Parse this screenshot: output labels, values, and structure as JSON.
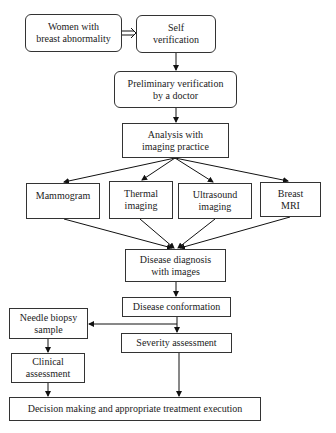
{
  "diagram": {
    "type": "flowchart",
    "nodes": {
      "women": {
        "label": "Women with\nbreast abnormality"
      },
      "self": {
        "label": "Self\nverification"
      },
      "prelim": {
        "label": "Preliminary verification\nby a doctor"
      },
      "analysis": {
        "label": "Analysis with\nimaging practice"
      },
      "mammogram": {
        "label": "Mammogram"
      },
      "thermal": {
        "label": "Thermal\nimaging"
      },
      "ultrasound": {
        "label": "Ultrasound\nimaging"
      },
      "mri": {
        "label": "Breast\nMRI"
      },
      "diagnosis": {
        "label": "Disease diagnosis\nwith images"
      },
      "conformation": {
        "label": "Disease conformation"
      },
      "needle": {
        "label": "Needle biopsy\nsample"
      },
      "severity": {
        "label": "Severity assessment"
      },
      "clinical": {
        "label": "Clinical\nassessment"
      },
      "decision": {
        "label": "Decision making and appropriate treatment execution"
      }
    },
    "edges": [
      [
        "women",
        "self"
      ],
      [
        "self",
        "prelim"
      ],
      [
        "prelim",
        "analysis"
      ],
      [
        "analysis",
        "mammogram"
      ],
      [
        "analysis",
        "thermal"
      ],
      [
        "analysis",
        "ultrasound"
      ],
      [
        "analysis",
        "mri"
      ],
      [
        "mammogram",
        "diagnosis"
      ],
      [
        "thermal",
        "diagnosis"
      ],
      [
        "ultrasound",
        "diagnosis"
      ],
      [
        "mri",
        "diagnosis"
      ],
      [
        "diagnosis",
        "conformation"
      ],
      [
        "conformation",
        "needle"
      ],
      [
        "conformation",
        "severity"
      ],
      [
        "needle",
        "clinical"
      ],
      [
        "clinical",
        "decision"
      ],
      [
        "severity",
        "decision"
      ]
    ]
  }
}
